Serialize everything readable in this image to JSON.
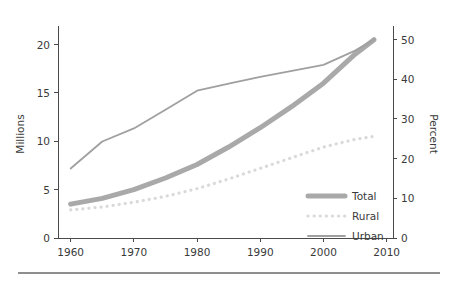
{
  "figure": {
    "background_color": "#ffffff",
    "footer_rule_color": "#8e8e8e"
  },
  "axes": {
    "left": {
      "title": "Millions",
      "ticks": [
        "0",
        "5",
        "10",
        "15",
        "20"
      ],
      "tick_values": [
        0,
        5,
        10,
        15,
        20
      ],
      "range": [
        0,
        21.5
      ]
    },
    "right": {
      "title": "Percent",
      "ticks": [
        "0",
        "10",
        "20",
        "30",
        "40",
        "50"
      ],
      "tick_values": [
        0,
        10,
        20,
        30,
        40,
        50
      ],
      "range": [
        0,
        52.4
      ]
    },
    "bottom": {
      "title": "",
      "ticks": [
        "1960",
        "1970",
        "1980",
        "1990",
        "2000",
        "2010"
      ],
      "tick_values": [
        1960,
        1970,
        1980,
        1990,
        2000,
        2010
      ],
      "range": [
        1958,
        2011
      ]
    }
  },
  "legend": {
    "position": "bottom-right",
    "entries": [
      {
        "label": "Total",
        "color": "#a9a9a9",
        "style": "thick-solid"
      },
      {
        "label": "Rural",
        "color": "#d9d9d9",
        "style": "dotted"
      },
      {
        "label": "Urban",
        "color": "#a0a0a0",
        "style": "thin-solid"
      }
    ]
  },
  "chart_data": {
    "type": "line",
    "title": "",
    "subtitle": "",
    "xlabel": "",
    "ylabel": "Millions",
    "y2label": "Percent",
    "xlim": [
      1958,
      2011
    ],
    "ylim": [
      0,
      21.5
    ],
    "y2lim": [
      0,
      52.4
    ],
    "grid": false,
    "legend_position": "bottom-right",
    "x": [
      1960,
      1965,
      1970,
      1975,
      1980,
      1985,
      1990,
      1995,
      2000,
      2005,
      2008
    ],
    "series": [
      {
        "name": "Total",
        "axis": "left",
        "units": "Millions",
        "color": "#a9a9a9",
        "style": "thick-solid",
        "values": [
          3.5,
          4.1,
          5.0,
          6.2,
          7.6,
          9.4,
          11.4,
          13.6,
          16.0,
          19.0,
          20.5
        ]
      },
      {
        "name": "Rural",
        "axis": "left",
        "units": "Millions",
        "color": "#d9d9d9",
        "style": "dotted",
        "values": [
          2.9,
          3.2,
          3.7,
          4.3,
          5.1,
          6.1,
          7.2,
          8.3,
          9.4,
          10.2,
          10.5
        ]
      },
      {
        "name": "Urban",
        "axis": "right",
        "units": "Percent",
        "color": "#a0a0a0",
        "style": "thin-solid",
        "values": [
          17.5,
          24.3,
          27.6,
          32.3,
          37.1,
          38.9,
          40.6,
          42.1,
          43.6,
          47.2,
          50.0
        ]
      }
    ],
    "annotations": [
      "Urban series has a visible slope change (kink) at 1980",
      "Total series crosses the Urban series near 2003"
    ]
  }
}
